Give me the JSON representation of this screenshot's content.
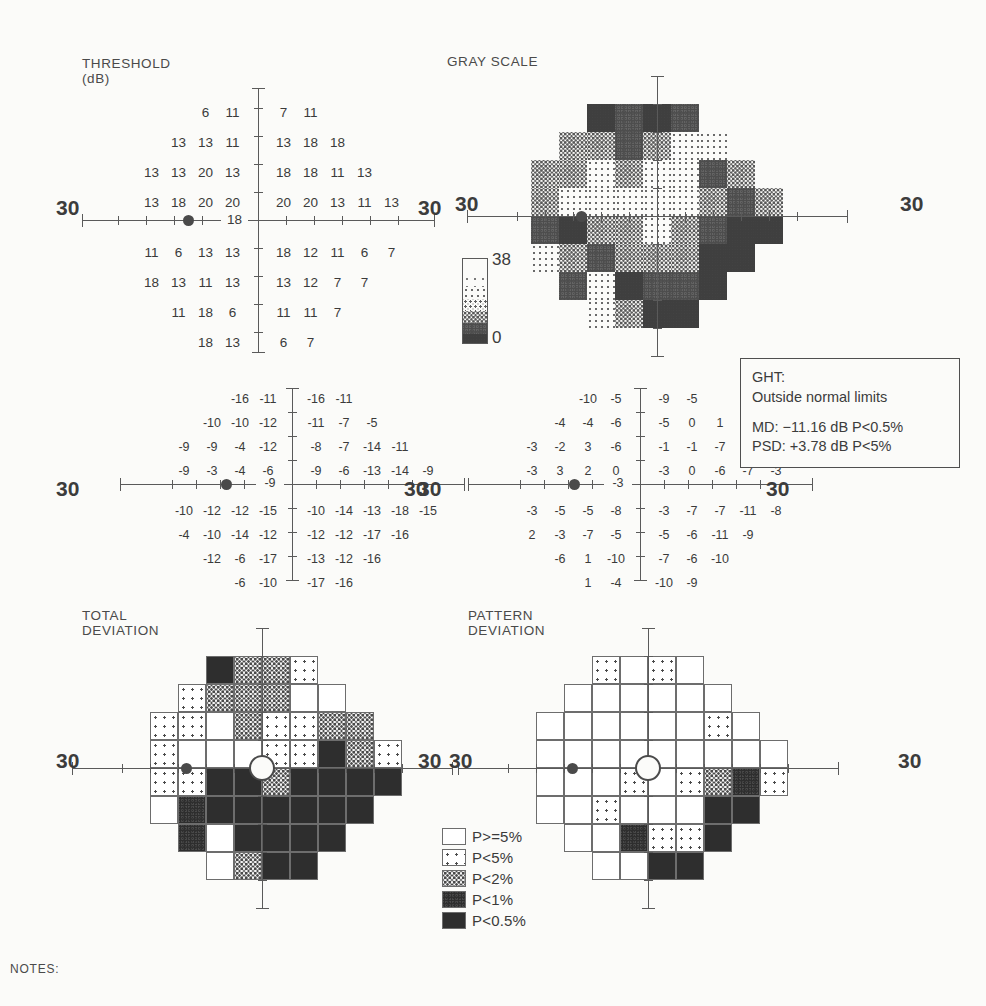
{
  "report": {
    "type": "humphrey-visual-field-30-2-single-field-analysis",
    "notes_label": "NOTES:"
  },
  "threshold": {
    "title": "THRESHOLD\n(dB)",
    "left_axis_label": "30",
    "right_axis_label": "30",
    "blind_spot_value": "18",
    "rows": [
      {
        "left": [
          "6",
          "11"
        ],
        "right": [
          "7",
          "11"
        ]
      },
      {
        "left": [
          "13",
          "13",
          "11"
        ],
        "right": [
          "13",
          "18",
          "18"
        ]
      },
      {
        "left": [
          "13",
          "13",
          "20",
          "13"
        ],
        "right": [
          "18",
          "18",
          "11",
          "13"
        ]
      },
      {
        "left": [
          "13",
          "18",
          "20",
          "20"
        ],
        "right": [
          "20",
          "20",
          "13",
          "11",
          "13"
        ]
      },
      {
        "left": [
          "11",
          "6",
          "13",
          "13"
        ],
        "right": [
          "18",
          "12",
          "11",
          "6",
          "7"
        ]
      },
      {
        "left": [
          "18",
          "13",
          "11",
          "13"
        ],
        "right": [
          "13",
          "12",
          "7",
          "7"
        ]
      },
      {
        "left": [
          "11",
          "18",
          "6"
        ],
        "right": [
          "11",
          "11",
          "7"
        ]
      },
      {
        "left": [
          "18",
          "13"
        ],
        "right": [
          "6",
          "7"
        ]
      }
    ]
  },
  "gray_scale": {
    "title": "GRAY SCALE",
    "left_axis_label": "30",
    "right_axis_label": "30",
    "key_top_label": "38",
    "key_bottom_label": "0"
  },
  "total_deviation_numeric": {
    "left_axis_label": "30",
    "right_axis_label": "30",
    "blind_spot_value": "-9",
    "rows": [
      {
        "left": [
          "-16",
          "-11"
        ],
        "right": [
          "-16",
          "-11"
        ]
      },
      {
        "left": [
          "-10",
          "-10",
          "-12"
        ],
        "right": [
          "-11",
          "-7",
          "-5"
        ]
      },
      {
        "left": [
          "-9",
          "-9",
          "-4",
          "-12"
        ],
        "right": [
          "-8",
          "-7",
          "-14",
          "-11"
        ]
      },
      {
        "left": [
          "-9",
          "-3",
          "-4",
          "-6"
        ],
        "right": [
          "-9",
          "-6",
          "-13",
          "-14",
          "-9"
        ]
      },
      {
        "left": [
          "-10",
          "-12",
          "-12",
          "-15"
        ],
        "right": [
          "-10",
          "-14",
          "-13",
          "-18",
          "-15"
        ]
      },
      {
        "left": [
          "-4",
          "-10",
          "-14",
          "-12"
        ],
        "right": [
          "-12",
          "-12",
          "-17",
          "-16"
        ]
      },
      {
        "left": [
          "-12",
          "-6",
          "-17"
        ],
        "right": [
          "-13",
          "-12",
          "-16"
        ]
      },
      {
        "left": [
          "-6",
          "-10"
        ],
        "right": [
          "-17",
          "-16"
        ]
      }
    ]
  },
  "pattern_deviation_numeric": {
    "left_axis_label": "30",
    "right_axis_label": "30",
    "blind_spot_value": "-3",
    "rows": [
      {
        "left": [
          "-10",
          "-5"
        ],
        "right": [
          "-9",
          "-5"
        ]
      },
      {
        "left": [
          "-4",
          "-4",
          "-6"
        ],
        "right": [
          "-5",
          "0",
          "1"
        ]
      },
      {
        "left": [
          "-3",
          "-2",
          "3",
          "-6"
        ],
        "right": [
          "-1",
          "-1",
          "-7",
          "-4"
        ]
      },
      {
        "left": [
          "-3",
          "3",
          "2",
          "0"
        ],
        "right": [
          "-3",
          "0",
          "-6",
          "-7",
          "-3"
        ]
      },
      {
        "left": [
          "-3",
          "-5",
          "-5",
          "-8"
        ],
        "right": [
          "-3",
          "-7",
          "-7",
          "-11",
          "-8"
        ]
      },
      {
        "left": [
          "2",
          "-3",
          "-7",
          "-5"
        ],
        "right": [
          "-5",
          "-6",
          "-11",
          "-9"
        ]
      },
      {
        "left": [
          "-6",
          "1",
          "-10"
        ],
        "right": [
          "-7",
          "-6",
          "-10"
        ]
      },
      {
        "left": [
          "1",
          "-4"
        ],
        "right": [
          "-10",
          "-9"
        ]
      }
    ]
  },
  "ght": {
    "label": "GHT:",
    "result": "Outside normal limits",
    "md_line": "MD: −11.16 dB P<0.5%",
    "psd_line": "PSD: +3.78 dB P<5%",
    "md_value": "-11.16",
    "md_unit": "dB",
    "md_p": "P<0.5%",
    "psd_value": "+3.78",
    "psd_unit": "dB",
    "psd_p": "P<5%"
  },
  "total_deviation_plot": {
    "title": "TOTAL\nDEVIATION",
    "left_axis_label": "30",
    "right_axis_label": "30",
    "rows": [
      {
        "left": [
          null,
          null,
          "p1",
          "p3"
        ],
        "right": [
          "p3",
          "p4",
          null,
          null
        ]
      },
      {
        "left": [
          null,
          "p4",
          "p3",
          "p3"
        ],
        "right": [
          "p3",
          "p5",
          "p5",
          null
        ]
      },
      {
        "left": [
          "p4",
          "p4",
          "p5",
          "p3"
        ],
        "right": [
          "p4",
          "p4",
          "p3",
          "p3"
        ]
      },
      {
        "left": [
          "p4",
          "p5",
          "p5",
          "p5"
        ],
        "right": [
          "p4",
          "p4",
          "p1",
          "p3",
          "p4"
        ]
      },
      {
        "left": [
          "p4",
          "p4",
          "p1",
          "p1"
        ],
        "right": [
          "p3",
          "p1",
          "p1",
          "p1",
          "p1"
        ]
      },
      {
        "left": [
          "p5",
          "p2",
          "p1",
          "p1"
        ],
        "right": [
          "p1",
          "p1",
          "p1",
          "p1"
        ]
      },
      {
        "left": [
          null,
          "p2",
          "p5",
          "p1"
        ],
        "right": [
          "p1",
          "p1",
          "p1"
        ]
      },
      {
        "left": [
          null,
          null,
          "p5",
          "p3"
        ],
        "right": [
          "p1",
          "p1"
        ]
      }
    ]
  },
  "pattern_deviation_plot": {
    "title": "PATTERN\nDEVIATION",
    "left_axis_label": "30",
    "right_axis_label": "30",
    "rows": [
      {
        "left": [
          null,
          null,
          "p4",
          "p5"
        ],
        "right": [
          "p4",
          "p5",
          null,
          null
        ]
      },
      {
        "left": [
          null,
          "p5",
          "p5",
          "p5"
        ],
        "right": [
          "p5",
          "p5",
          "p5",
          null
        ]
      },
      {
        "left": [
          "p5",
          "p5",
          "p5",
          "p5"
        ],
        "right": [
          "p5",
          "p5",
          "p4",
          "p5"
        ]
      },
      {
        "left": [
          "p5",
          "p5",
          "p5",
          "p5"
        ],
        "right": [
          "p5",
          "p5",
          "p5",
          "p5",
          "p5"
        ]
      },
      {
        "left": [
          "p5",
          "p5",
          "p5",
          "p4"
        ],
        "right": [
          "p5",
          "p4",
          "p3",
          "p2",
          "p4"
        ]
      },
      {
        "left": [
          "p5",
          "p5",
          "p4",
          "p5"
        ],
        "right": [
          "p5",
          "p5",
          "p1",
          "p1"
        ]
      },
      {
        "left": [
          null,
          "p5",
          "p5",
          "p2"
        ],
        "right": [
          "p4",
          "p4",
          "p1"
        ]
      },
      {
        "left": [
          null,
          null,
          "p5",
          "p5"
        ],
        "right": [
          "p1",
          "p1"
        ]
      }
    ]
  },
  "probability_legend": {
    "items": [
      {
        "key": "p5",
        "label": "P>=5%"
      },
      {
        "key": "p4",
        "label": "P<5%"
      },
      {
        "key": "p3",
        "label": "P<2%"
      },
      {
        "key": "p2",
        "label": "P<1%"
      },
      {
        "key": "p1",
        "label": "P<0.5%"
      }
    ]
  },
  "chart_data": {
    "type": "heatmap",
    "grid_pattern_row_counts": [
      4,
      6,
      8,
      9,
      9,
      8,
      6,
      4
    ],
    "threshold_db": {
      "label": "THRESHOLD (dB)",
      "unit": "dB",
      "rows": [
        [
          null,
          null,
          6,
          11,
          7,
          11,
          null,
          null,
          null
        ],
        [
          null,
          13,
          13,
          11,
          13,
          18,
          18,
          null,
          null
        ],
        [
          13,
          13,
          20,
          13,
          18,
          18,
          11,
          13,
          null
        ],
        [
          13,
          18,
          20,
          20,
          20,
          20,
          13,
          11,
          13
        ],
        [
          11,
          6,
          13,
          13,
          18,
          12,
          11,
          6,
          7
        ],
        [
          18,
          13,
          11,
          13,
          13,
          12,
          7,
          7,
          null
        ],
        [
          null,
          11,
          18,
          6,
          11,
          11,
          7,
          null,
          null
        ],
        [
          null,
          null,
          18,
          13,
          6,
          7,
          null,
          null,
          null
        ]
      ],
      "blind_spot_value": 18
    },
    "total_deviation_db": {
      "label": "TOTAL DEVIATION",
      "unit": "dB",
      "rows": [
        [
          null,
          null,
          -16,
          -11,
          -16,
          -11,
          null,
          null,
          null
        ],
        [
          null,
          -10,
          -10,
          -12,
          -11,
          -7,
          -5,
          null,
          null
        ],
        [
          -9,
          -9,
          -4,
          -12,
          -8,
          -7,
          -14,
          -11,
          null
        ],
        [
          -9,
          -3,
          -4,
          -6,
          -9,
          -6,
          -13,
          -14,
          -9
        ],
        [
          -10,
          -12,
          -12,
          -15,
          -10,
          -14,
          -13,
          -18,
          -15
        ],
        [
          -4,
          -10,
          -14,
          -12,
          -12,
          -12,
          -17,
          -16,
          null
        ],
        [
          null,
          -12,
          -6,
          -17,
          -13,
          -12,
          -16,
          null,
          null
        ],
        [
          null,
          null,
          -6,
          -10,
          -17,
          -16,
          null,
          null,
          null
        ]
      ],
      "blind_spot_value": -9
    },
    "pattern_deviation_db": {
      "label": "PATTERN DEVIATION",
      "unit": "dB",
      "rows": [
        [
          null,
          null,
          -10,
          -5,
          -9,
          -5,
          null,
          null,
          null
        ],
        [
          null,
          -4,
          -4,
          -6,
          -5,
          0,
          1,
          null,
          null
        ],
        [
          -3,
          -2,
          3,
          -6,
          -1,
          -1,
          -7,
          -4,
          null
        ],
        [
          -3,
          3,
          2,
          0,
          -3,
          0,
          -6,
          -7,
          -3
        ],
        [
          -3,
          -5,
          -5,
          -8,
          -3,
          -7,
          -7,
          -11,
          -8
        ],
        [
          2,
          -3,
          -7,
          -5,
          -5,
          -6,
          -11,
          -9,
          null
        ],
        [
          null,
          -6,
          1,
          -10,
          -7,
          -6,
          -10,
          null,
          null
        ],
        [
          null,
          null,
          1,
          -4,
          -10,
          -9,
          null,
          null,
          null
        ]
      ],
      "blind_spot_value": -3
    },
    "gray_scale_range": [
      0,
      38
    ],
    "global_indices": {
      "GHT": "Outside normal limits",
      "MD": -11.16,
      "MD_p": "P<0.5%",
      "PSD": 3.78,
      "PSD_p": "P<5%"
    },
    "probability_scale": [
      "P>=5%",
      "P<5%",
      "P<2%",
      "P<1%",
      "P<0.5%"
    ]
  }
}
